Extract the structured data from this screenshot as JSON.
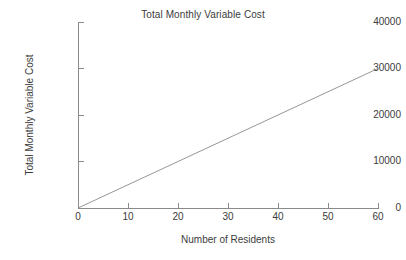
{
  "chart_data": {
    "type": "line",
    "title": "Total Monthly Variable Cost",
    "xlabel": "Number of Residents",
    "ylabel": "Total Monthly Variable Cost",
    "xlim": [
      0,
      60
    ],
    "ylim": [
      0,
      40000
    ],
    "grid": false,
    "legend": "none",
    "xticks": [
      0,
      10,
      20,
      30,
      40,
      50,
      60
    ],
    "xtick_labels": [
      "0",
      "10",
      "20",
      "30",
      "40",
      "50",
      "60"
    ],
    "yticks": [
      0,
      10000,
      20000,
      30000,
      40000
    ],
    "ytick_labels": [
      "0",
      "10000",
      "20000",
      "30000",
      "40000"
    ],
    "series": [
      {
        "name": "Total Monthly Variable Cost",
        "color": "#8a8a8a",
        "x": [
          0,
          10,
          20,
          30,
          40,
          50,
          60
        ],
        "values": [
          0,
          5000,
          10000,
          15000,
          20000,
          25000,
          30000
        ]
      }
    ],
    "annotations": []
  },
  "style": {
    "background": "#ffffff",
    "axis_color": "#8a8a8a",
    "text_color": "#3b3b3b",
    "line_color": "#8a8a8a"
  }
}
